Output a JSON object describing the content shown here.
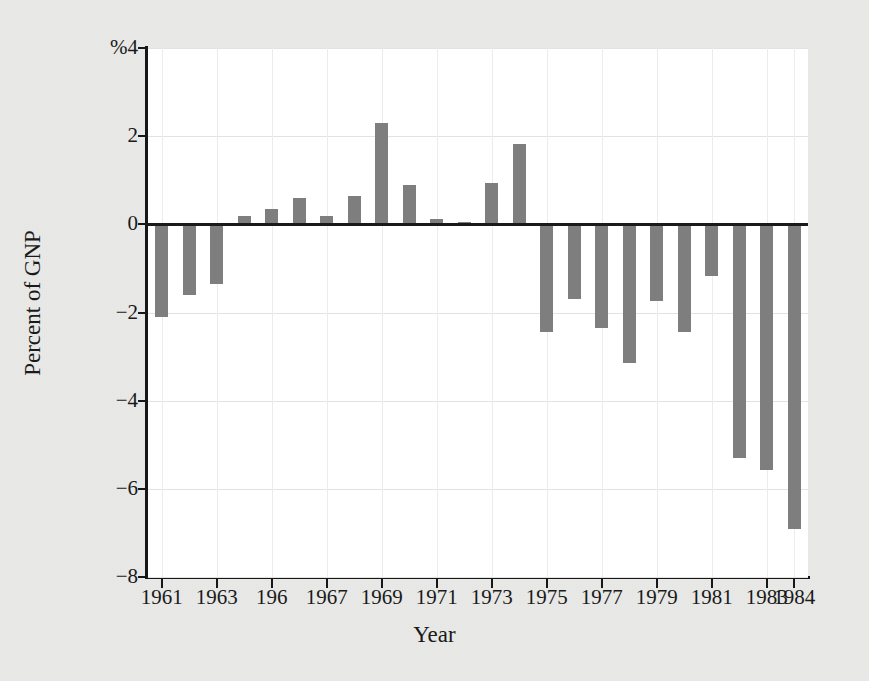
{
  "chart_data": {
    "type": "bar",
    "title": "",
    "xlabel": "Year",
    "ylabel": "Percent of GNP",
    "ylim": [
      -8,
      4
    ],
    "xlim": [
      1960.5,
      1984.5
    ],
    "grid": true,
    "legend": null,
    "y_unit_prefix": "%",
    "y_ticks": [
      4,
      2,
      0,
      -2,
      -4,
      -6,
      -8
    ],
    "y_tick_labels": [
      "%4",
      "2",
      "0",
      "-2",
      "-4",
      "-6",
      "-8"
    ],
    "x_ticks": [
      1961,
      1963,
      1965,
      1967,
      1969,
      1971,
      1973,
      1975,
      1977,
      1979,
      1981,
      1983,
      1984
    ],
    "x_tick_labels": [
      "1961",
      "1963",
      "196",
      "1967",
      "1969",
      "1971",
      "1973",
      "1975",
      "1977",
      "1979",
      "1981",
      "1983",
      "1984"
    ],
    "bar_color": "#7e7e7e",
    "categories": [
      1961,
      1962,
      1963,
      1964,
      1965,
      1966,
      1967,
      1968,
      1969,
      1970,
      1971,
      1972,
      1973,
      1974,
      1975,
      1976,
      1977,
      1978,
      1979,
      1980,
      1981,
      1982,
      1983,
      1984
    ],
    "values": [
      -2.1,
      -1.6,
      -1.35,
      0.2,
      0.35,
      0.6,
      0.2,
      0.65,
      2.3,
      0.9,
      0.12,
      0.05,
      0.93,
      1.82,
      -2.45,
      -1.7,
      -2.35,
      -3.15,
      -1.75,
      -2.45,
      -1.18,
      -5.3,
      -5.58,
      -6.9
    ]
  },
  "axis": {
    "y_title": "Percent of GNP",
    "x_title": "Year"
  },
  "figure": {
    "background_color": "#e9e9e7",
    "plot_background_color": "#ffffff",
    "axis_color": "#171717",
    "grid_color": "#e2e2e2"
  }
}
